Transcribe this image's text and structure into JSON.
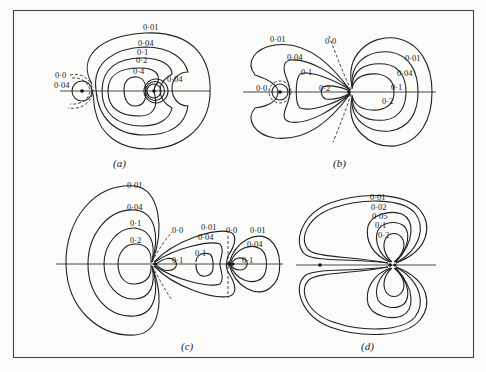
{
  "figure": {
    "panels": [
      {
        "id": "a",
        "caption": "(a)",
        "labels": [
          "0·01",
          "0·04",
          "0·1",
          "0·2",
          "0·4",
          "0·04",
          "0·0",
          "0·04"
        ]
      },
      {
        "id": "b",
        "caption": "(b)",
        "labels": [
          "0·01",
          "0·0",
          "0·04",
          "0·1",
          "0·2",
          "0·0",
          "0·01",
          "0·04",
          "0·1",
          "0·2"
        ]
      },
      {
        "id": "c",
        "caption": "(c)",
        "labels": [
          "0·01",
          "0·04",
          "0·1",
          "0·2",
          "0·0",
          "0·1",
          "0·01",
          "0·04",
          "0·1",
          "0·0",
          "0·01",
          "0·04",
          "0·1"
        ]
      },
      {
        "id": "d",
        "caption": "(d)",
        "labels": [
          "0·01",
          "0·02",
          "0·05",
          "0·1",
          "0·2"
        ]
      }
    ]
  }
}
